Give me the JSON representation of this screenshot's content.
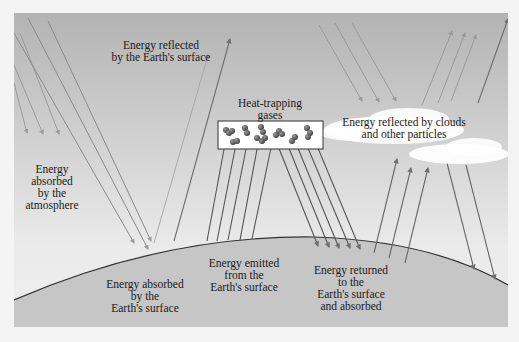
{
  "diagram": {
    "labels": {
      "reflected_surface": "Energy reflected\nby the Earth's surface",
      "heat_trapping": "Heat-trapping\ngases",
      "reflected_clouds": "Energy reflected by clouds\nand other particles",
      "absorbed_atmosphere": "Energy\nabsorbed\nby the\natmosphere",
      "absorbed_surface": "Energy absorbed\nby the\nEarth's surface",
      "emitted_surface": "Energy emitted\nfrom the\nEarth's surface",
      "returned_surface": "Energy returned\nto the\nEarth's surface\nand absorbed"
    },
    "colors": {
      "sky_top": "#b5b5b5",
      "sky_bottom": "#ececec",
      "earth": "#c8c8c8",
      "arrow": "#6e6e6e",
      "arrow_light": "#9a9a9a",
      "cloud": "#ffffff",
      "molecule": "#555555"
    }
  }
}
